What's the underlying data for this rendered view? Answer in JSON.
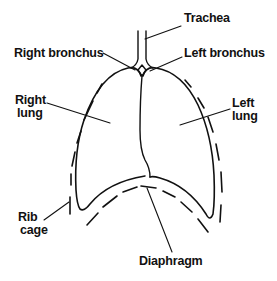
{
  "diagram": {
    "labels": {
      "trachea": "Trachea",
      "right_bronchus": "Right bronchus",
      "left_bronchus": "Left bronchus",
      "right_lung_line1": "Right",
      "right_lung_line2": "lung",
      "left_lung_line1": "Left",
      "left_lung_line2": "lung",
      "rib_cage_line1": "Rib",
      "rib_cage_line2": "cage",
      "diaphragm": "Diaphragm"
    },
    "colors": {
      "ink": "#111111",
      "background": "#ffffff"
    }
  }
}
